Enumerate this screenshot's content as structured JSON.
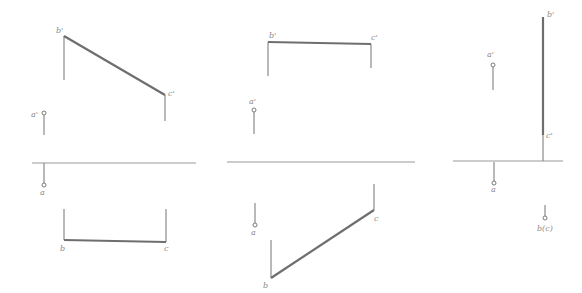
{
  "panels": [
    {
      "id": "panel-1",
      "labels": {
        "b_prime": "b'",
        "c_prime": "c'",
        "a_prime": "a'",
        "a": "a",
        "b": "b",
        "c": "c"
      }
    },
    {
      "id": "panel-2",
      "labels": {
        "b_prime": "b'",
        "c_prime": "c'",
        "a_prime": "a'",
        "a": "a",
        "b": "b",
        "c": "c"
      }
    },
    {
      "id": "panel-3",
      "labels": {
        "b_prime": "b'",
        "c_prime": "c'",
        "a_prime": "a'",
        "a": "a",
        "bc": "b(c)"
      }
    }
  ],
  "colors": {
    "line": "#8a8a8a",
    "thick_line": "#6e6e6e",
    "axis": "#9a9a9a",
    "background": "#ffffff"
  }
}
